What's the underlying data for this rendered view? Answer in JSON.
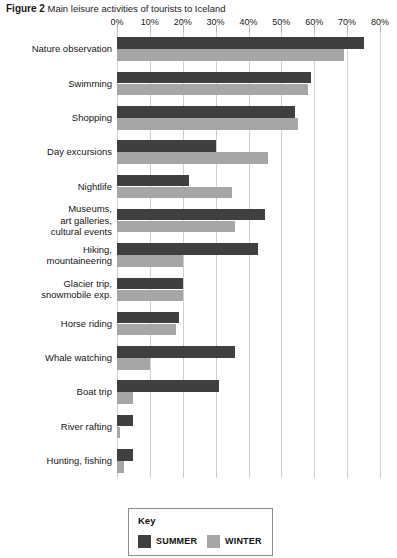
{
  "figure": {
    "label": "Figure 2",
    "caption": "Main leisure activities of tourists to Iceland"
  },
  "legend": {
    "title": "Key",
    "entries": [
      {
        "name": "summer-swatch",
        "label": "SUMMER",
        "color": "#3f3f3f"
      },
      {
        "name": "winter-swatch",
        "label": "WINTER",
        "color": "#a6a6a6"
      }
    ]
  },
  "colors": {
    "summer": "#3f3f3f",
    "winter": "#a6a6a6",
    "gridline": "#cfcfcf",
    "background": "#ffffff"
  },
  "chart_data": {
    "type": "bar",
    "orientation": "horizontal",
    "title": "Main leisure activities of tourists to Iceland",
    "xlabel": "",
    "ylabel": "",
    "xlim": [
      0,
      80
    ],
    "xtick_labels": [
      "0%",
      "10%",
      "20%",
      "30%",
      "40%",
      "50%",
      "60%",
      "70%",
      "80%"
    ],
    "xticks": [
      0,
      10,
      20,
      30,
      40,
      50,
      60,
      70,
      80
    ],
    "grid": true,
    "legend_position": "bottom",
    "categories": [
      "Nature observation",
      "Swimming",
      "Shopping",
      "Day excursions",
      "Nightlife",
      "Museums, art galleries, cultural events",
      "Hiking, mountaineering",
      "Glacier trip, snowmobile exp.",
      "Horse riding",
      "Whale watching",
      "Boat trip",
      "River rafting",
      "Hunting, fishing"
    ],
    "category_lines": [
      [
        "Nature observation"
      ],
      [
        "Swimming"
      ],
      [
        "Shopping"
      ],
      [
        "Day excursions"
      ],
      [
        "Nightlife"
      ],
      [
        "Museums,",
        "art galleries,",
        "cultural events"
      ],
      [
        "Hiking,",
        "mountaineering"
      ],
      [
        "Glacier trip,",
        "snowmobile exp."
      ],
      [
        "Horse riding"
      ],
      [
        "Whale watching"
      ],
      [
        "Boat trip"
      ],
      [
        "River rafting"
      ],
      [
        "Hunting, fishing"
      ]
    ],
    "series": [
      {
        "name": "SUMMER",
        "color": "#3f3f3f",
        "values": [
          75,
          59,
          54,
          30,
          22,
          45,
          43,
          20,
          19,
          36,
          31,
          5,
          5
        ]
      },
      {
        "name": "WINTER",
        "color": "#a6a6a6",
        "values": [
          69,
          58,
          55,
          46,
          35,
          36,
          20,
          20,
          18,
          10,
          5,
          1,
          2
        ]
      }
    ]
  }
}
